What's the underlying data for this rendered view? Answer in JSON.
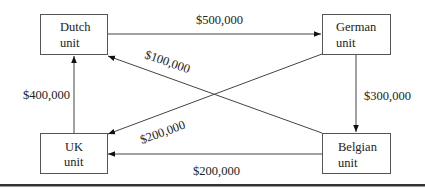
{
  "diagram": {
    "type": "flow-diagram",
    "nodes": [
      {
        "id": "dutch",
        "line1": "Dutch",
        "line2": "unit"
      },
      {
        "id": "german",
        "line1": "German",
        "line2": "unit"
      },
      {
        "id": "uk",
        "line1": "UK",
        "line2": "unit"
      },
      {
        "id": "belgian",
        "line1": "Belgian",
        "line2": "unit"
      }
    ],
    "edges": [
      {
        "from": "dutch",
        "to": "german",
        "label": "$500,000"
      },
      {
        "from": "german",
        "to": "belgian",
        "label": "$300,000"
      },
      {
        "from": "belgian",
        "to": "dutch",
        "label": "$100,000"
      },
      {
        "from": "german",
        "to": "uk",
        "label": "$200,000"
      },
      {
        "from": "belgian",
        "to": "uk",
        "label": "$200,000"
      },
      {
        "from": "uk",
        "to": "dutch",
        "label": "$400,000"
      }
    ]
  }
}
